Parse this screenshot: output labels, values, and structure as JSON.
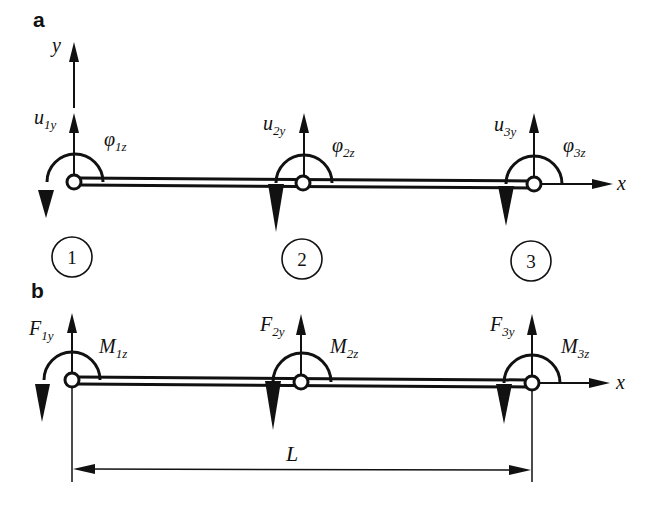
{
  "diagram": {
    "type": "beam-element-dof-diagram",
    "panels": {
      "a": {
        "label": "a",
        "axis_y_label": "y",
        "axis_x_label": "x",
        "nodes": [
          {
            "number": "1",
            "displacement": {
              "base": "u",
              "sub": "1y"
            },
            "rotation": {
              "base": "φ",
              "sub": "1z"
            }
          },
          {
            "number": "2",
            "displacement": {
              "base": "u",
              "sub": "2y"
            },
            "rotation": {
              "base": "φ",
              "sub": "2z"
            }
          },
          {
            "number": "3",
            "displacement": {
              "base": "u",
              "sub": "3y"
            },
            "rotation": {
              "base": "φ",
              "sub": "3z"
            }
          }
        ]
      },
      "b": {
        "label": "b",
        "axis_x_label": "x",
        "nodes": [
          {
            "force": {
              "base": "F",
              "sub": "1y"
            },
            "moment": {
              "base": "M",
              "sub": "1z"
            }
          },
          {
            "force": {
              "base": "F",
              "sub": "2y"
            },
            "moment": {
              "base": "M",
              "sub": "2z"
            }
          },
          {
            "force": {
              "base": "F",
              "sub": "3y"
            },
            "moment": {
              "base": "M",
              "sub": "3z"
            }
          }
        ],
        "dimension_label": "L"
      }
    },
    "colors": {
      "ink": "#111111",
      "background": "#ffffff"
    }
  }
}
